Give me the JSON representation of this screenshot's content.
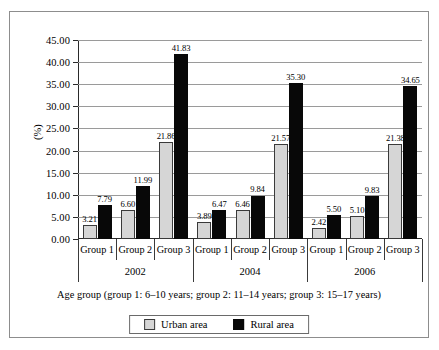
{
  "chart_data": {
    "type": "bar",
    "title": "",
    "xlabel": "Age group (group 1: 6–10 years; group 2: 11–14 years; group 3: 15–17 years)",
    "ylabel": "(%)",
    "ylim": [
      0,
      45
    ],
    "ytick_step": 5,
    "ytick_labels": [
      "0.00",
      "5.00",
      "10.00",
      "15.00",
      "20.00",
      "25.00",
      "30.00",
      "35.00",
      "40.00",
      "45.00"
    ],
    "grid": true,
    "legend_position": "bottom",
    "group_separators": [
      "2002",
      "2004",
      "2006"
    ],
    "categories": [
      "Group 1",
      "Group 2",
      "Group 3",
      "Group 1",
      "Group 2",
      "Group 3",
      "Group 1",
      "Group 2",
      "Group 3"
    ],
    "series": [
      {
        "name": "Urban area",
        "color": "#d6d6d6",
        "values": [
          3.21,
          6.6,
          21.86,
          3.89,
          6.46,
          21.57,
          2.42,
          5.1,
          21.38
        ]
      },
      {
        "name": "Rural area",
        "color": "#080808",
        "values": [
          7.79,
          11.99,
          41.83,
          6.47,
          9.84,
          35.3,
          5.5,
          9.83,
          34.65
        ]
      }
    ],
    "data_labels": [
      "3.21",
      "7.79",
      "6.60",
      "11.99",
      "21.86",
      "41.83",
      "3.89",
      "6.47",
      "6.46",
      "9.84",
      "21.57",
      "35.30",
      "2.42",
      "5.50",
      "5.10",
      "9.83",
      "21.38",
      "34.65"
    ]
  },
  "legend": {
    "items": [
      {
        "label": "Urban area",
        "swatch": "urban"
      },
      {
        "label": "Rural area",
        "swatch": "rural"
      }
    ]
  }
}
